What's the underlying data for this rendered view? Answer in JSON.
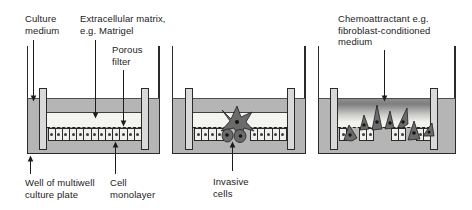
{
  "figure": {
    "title_semantic": "In vitro invasion assay in multiwell plate inserts",
    "labels": {
      "culture_medium": "Culture\nmedium",
      "ecm": "Extracellular matrix,\ne.g. Matrigel",
      "porous_filter": "Porous\nfilter",
      "chemoattractant": "Chemoattractant e.g.\nfibroblast-conditioned\nmedium",
      "well": "Well of multiwell\nculture plate",
      "cell_monolayer": "Cell\nmonolayer",
      "invasive_cells": "Invasive\ncells"
    },
    "colors": {
      "medium_gray": "#b5b5b5",
      "insert_wall_gray": "#d9d9d9",
      "matrix_white": "#f4f4f1",
      "cell_fill": "#efefec",
      "invasive_cell_fill": "#6b6b6b",
      "outline": "#2a2a2a",
      "text": "#1c1c1c"
    },
    "panels": [
      {
        "name": "panel-1",
        "cell_groups": [
          {
            "x": 47.5,
            "n": 13
          }
        ]
      },
      {
        "name": "panel-2",
        "cell_groups": [
          {
            "x": 194,
            "n": 4
          },
          {
            "x": 250,
            "n": 5
          }
        ]
      },
      {
        "name": "panel-3",
        "cell_groups": [
          {
            "x": 339,
            "n": 1
          },
          {
            "x": 359,
            "n": 2
          },
          {
            "x": 391,
            "n": 2
          },
          {
            "x": 416,
            "n": 2
          }
        ]
      }
    ]
  }
}
